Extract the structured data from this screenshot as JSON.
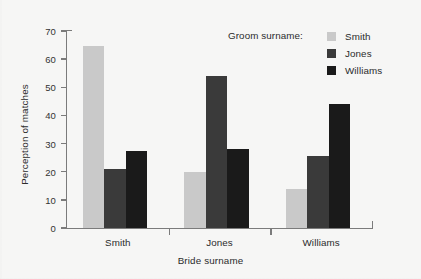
{
  "chart_data": {
    "type": "bar",
    "title": "",
    "subtitle": "",
    "xlabel": "Bride surname",
    "ylabel": "Perception of matches",
    "categories": [
      "Smith",
      "Jones",
      "Williams"
    ],
    "series": [
      {
        "name": "Smith",
        "color": "#c9c9c9",
        "values": [
          64.5,
          20.0,
          14.0
        ]
      },
      {
        "name": "Jones",
        "color": "#3a3a3a",
        "values": [
          21.0,
          54.0,
          25.5
        ]
      },
      {
        "name": "Williams",
        "color": "#1a1a1a",
        "values": [
          27.5,
          28.0,
          44.0
        ]
      }
    ],
    "ylim": [
      0,
      70
    ],
    "yticks": [
      0,
      10,
      20,
      30,
      40,
      50,
      60,
      70
    ],
    "ytick_labels": [
      "0",
      "10",
      "20",
      "30",
      "40",
      "50",
      "60",
      "70"
    ],
    "grid": false,
    "legend_position": "top-right",
    "legend_title": "Groom surname:",
    "axis_color": "#7b7b7b",
    "background_color": "#f6f6f5"
  },
  "legend": {
    "title": "Groom surname:",
    "entries": [
      {
        "label": "Smith",
        "color": "#c9c9c9"
      },
      {
        "label": "Jones",
        "color": "#3a3a3a"
      },
      {
        "label": "Williams",
        "color": "#1a1a1a"
      }
    ]
  },
  "axes": {
    "x_title": "Bride surname",
    "y_title": "Perception of matches"
  }
}
